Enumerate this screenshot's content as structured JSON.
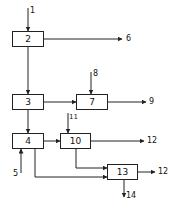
{
  "diagram": {
    "blocks": [
      {
        "id": "2",
        "label": "2"
      },
      {
        "id": "3",
        "label": "3"
      },
      {
        "id": "4",
        "label": "4"
      },
      {
        "id": "7",
        "label": "7"
      },
      {
        "id": "10",
        "label": "10"
      },
      {
        "id": "13",
        "label": "13"
      }
    ],
    "flow_labels": {
      "in_1": "1",
      "out_6": "6",
      "in_8": "8",
      "out_9": "9",
      "in_11": "11",
      "in_5": "5",
      "out_12a": "12",
      "out_12b": "12",
      "out_14": "14"
    },
    "edges": [
      {
        "from": "1",
        "to": "2"
      },
      {
        "from": "2",
        "to": "6"
      },
      {
        "from": "2",
        "to": "3"
      },
      {
        "from": "3",
        "to": "7"
      },
      {
        "from": "8",
        "to": "7"
      },
      {
        "from": "7",
        "to": "9"
      },
      {
        "from": "3",
        "to": "4"
      },
      {
        "from": "5",
        "to": "4"
      },
      {
        "from": "4",
        "to": "10"
      },
      {
        "from": "11",
        "to": "10"
      },
      {
        "from": "10",
        "to": "12"
      },
      {
        "from": "10",
        "to": "13"
      },
      {
        "from": "4",
        "to": "13"
      },
      {
        "from": "13",
        "to": "12"
      },
      {
        "from": "13",
        "to": "14"
      }
    ]
  }
}
